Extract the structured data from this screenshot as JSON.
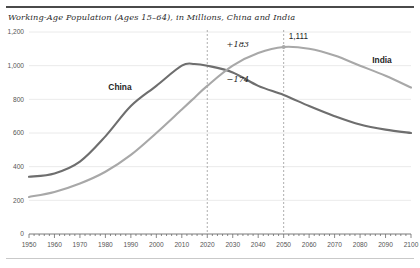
{
  "chart_data": {
    "type": "line",
    "title": "Working-Age Population (Ages 15–64), in Millions, China and India",
    "xlabel": "",
    "ylabel": "",
    "xlim": [
      1950,
      2100
    ],
    "ylim": [
      0,
      1200
    ],
    "grid": "horizontal",
    "legend_position": "inline-labels",
    "ytick_labels": [
      "0",
      "200",
      "400",
      "600",
      "800",
      "1,000",
      "1,200"
    ],
    "ytick_values": [
      0,
      200,
      400,
      600,
      800,
      1000,
      1200
    ],
    "xtick_labels": [
      "1950",
      "1960",
      "1970",
      "1980",
      "1990",
      "2000",
      "2010",
      "2020",
      "2030",
      "2040",
      "2050",
      "2060",
      "2070",
      "2080",
      "2090",
      "2100"
    ],
    "xtick_values": [
      1950,
      1960,
      1970,
      1980,
      1990,
      2000,
      2010,
      2020,
      2030,
      2040,
      2050,
      2060,
      2070,
      2080,
      2090,
      2100
    ],
    "x": [
      1950,
      1960,
      1970,
      1980,
      1990,
      2000,
      2010,
      2015,
      2020,
      2030,
      2040,
      2050,
      2060,
      2070,
      2080,
      2090,
      2100
    ],
    "series": [
      {
        "name": "China",
        "color": "#6e6e6e",
        "label": "China",
        "values": [
          340,
          360,
          430,
          580,
          760,
          880,
          1000,
          1010,
          1000,
          960,
          880,
          826,
          760,
          700,
          650,
          620,
          600
        ]
      },
      {
        "name": "India",
        "color": "#a8a8a8",
        "label": "India",
        "values": [
          220,
          250,
          300,
          370,
          470,
          600,
          740,
          810,
          880,
          1000,
          1075,
          1111,
          1100,
          1060,
          1000,
          940,
          870
        ]
      }
    ],
    "annotations": [
      {
        "text": "+183",
        "kind": "delta-india",
        "x": 2032,
        "y": 1110
      },
      {
        "text": "−174",
        "kind": "delta-china",
        "x": 2032,
        "y": 905
      },
      {
        "text": "1,111",
        "kind": "peak-india",
        "x": 2052,
        "y": 1160
      }
    ],
    "reference_lines": [
      {
        "kind": "vertical-dashed",
        "x": 2020
      },
      {
        "kind": "vertical-dashed",
        "x": 2050
      }
    ],
    "markers": [
      {
        "series": "India",
        "x": 2050,
        "y": 1111
      }
    ]
  }
}
